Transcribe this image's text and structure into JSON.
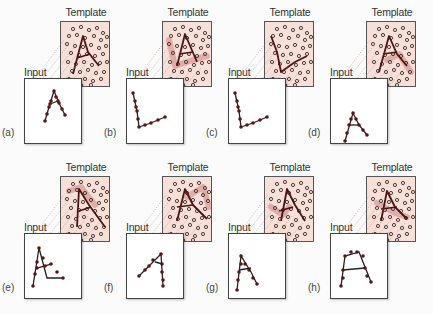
{
  "figure": {
    "template_label": "Template",
    "input_label": "Input",
    "colors": {
      "template_bg": "#f6e0d8",
      "stroke": "#4a1414",
      "highlight": "#c8706c",
      "dot_ring": "#3a2a2a",
      "link": "#c87878"
    },
    "template_dots": [
      [
        12,
        7
      ],
      [
        20,
        5
      ],
      [
        28,
        8
      ],
      [
        36,
        6
      ],
      [
        42,
        11
      ],
      [
        8,
        14
      ],
      [
        16,
        13
      ],
      [
        24,
        16
      ],
      [
        33,
        14
      ],
      [
        40,
        18
      ],
      [
        46,
        15
      ],
      [
        6,
        22
      ],
      [
        14,
        24
      ],
      [
        22,
        25
      ],
      [
        30,
        23
      ],
      [
        38,
        26
      ],
      [
        45,
        24
      ],
      [
        10,
        31
      ],
      [
        18,
        33
      ],
      [
        26,
        32
      ],
      [
        34,
        34
      ],
      [
        42,
        32
      ],
      [
        7,
        40
      ],
      [
        15,
        42
      ],
      [
        23,
        40
      ],
      [
        31,
        43
      ],
      [
        39,
        41
      ],
      [
        46,
        40
      ],
      [
        11,
        49
      ],
      [
        19,
        50
      ],
      [
        27,
        48
      ],
      [
        35,
        51
      ],
      [
        43,
        50
      ],
      [
        8,
        57
      ],
      [
        16,
        58
      ],
      [
        24,
        57
      ],
      [
        32,
        59
      ],
      [
        40,
        57
      ],
      [
        20,
        63
      ],
      [
        30,
        63
      ]
    ],
    "panels": [
      {
        "tag": "(a)",
        "left": 24,
        "top": 0,
        "template_stroke": [
          [
            12,
            52
          ],
          [
            22,
            14
          ],
          [
            27,
            30
          ],
          [
            38,
            44
          ]
        ],
        "template_bar": [
          [
            16,
            36
          ],
          [
            29,
            32
          ]
        ],
        "input_stroke": [
          [
            20,
            42
          ],
          [
            24,
            28
          ],
          [
            29,
            12
          ],
          [
            34,
            24
          ],
          [
            40,
            36
          ]
        ],
        "input_bar": [
          [
            25,
            25
          ],
          [
            33,
            22
          ]
        ],
        "input_dots": [
          [
            20,
            42
          ],
          [
            22,
            35
          ],
          [
            24,
            28
          ],
          [
            26,
            22
          ],
          [
            29,
            12
          ],
          [
            31,
            18
          ],
          [
            34,
            24
          ],
          [
            37,
            30
          ],
          [
            40,
            36
          ],
          [
            25,
            25
          ],
          [
            33,
            22
          ]
        ],
        "highlight": null
      },
      {
        "tag": "(b)",
        "left": 126,
        "top": 0,
        "template_stroke": [
          [
            14,
            44
          ],
          [
            22,
            12
          ],
          [
            34,
            40
          ]
        ],
        "template_bar": [
          [
            16,
            32
          ],
          [
            30,
            30
          ]
        ],
        "highlight_path": [
          [
            6,
            18
          ],
          [
            12,
            44
          ],
          [
            30,
            38
          ],
          [
            44,
            34
          ]
        ],
        "input_stroke": [
          [
            6,
            14
          ],
          [
            10,
            32
          ],
          [
            12,
            48
          ],
          [
            24,
            44
          ],
          [
            38,
            38
          ]
        ],
        "input_bar": null,
        "input_dots": [
          [
            6,
            14
          ],
          [
            8,
            22
          ],
          [
            9,
            28
          ],
          [
            10,
            32
          ],
          [
            11,
            40
          ],
          [
            12,
            48
          ],
          [
            18,
            46
          ],
          [
            24,
            44
          ],
          [
            31,
            41
          ],
          [
            38,
            38
          ]
        ]
      },
      {
        "tag": "(c)",
        "left": 228,
        "top": 0,
        "template_stroke": [
          [
            6,
            14
          ],
          [
            12,
            30
          ],
          [
            16,
            50
          ],
          [
            30,
            40
          ],
          [
            42,
            34
          ]
        ],
        "template_bar": null,
        "highlight_path": null,
        "input_stroke": [
          [
            6,
            14
          ],
          [
            10,
            32
          ],
          [
            12,
            48
          ],
          [
            24,
            44
          ],
          [
            38,
            38
          ]
        ],
        "input_bar": null,
        "input_dots": [
          [
            6,
            14
          ],
          [
            8,
            22
          ],
          [
            9,
            28
          ],
          [
            10,
            32
          ],
          [
            11,
            40
          ],
          [
            12,
            48
          ],
          [
            18,
            46
          ],
          [
            24,
            44
          ],
          [
            31,
            41
          ],
          [
            38,
            38
          ]
        ]
      },
      {
        "tag": "(d)",
        "left": 330,
        "top": 0,
        "template_stroke": [
          [
            12,
            50
          ],
          [
            22,
            14
          ],
          [
            30,
            32
          ],
          [
            40,
            44
          ]
        ],
        "template_bar": [
          [
            16,
            32
          ],
          [
            30,
            30
          ]
        ],
        "highlight_path": [
          [
            20,
            38
          ],
          [
            32,
            32
          ],
          [
            44,
            50
          ]
        ],
        "input_stroke": [
          [
            14,
            62
          ],
          [
            22,
            34
          ],
          [
            28,
            46
          ],
          [
            36,
            56
          ]
        ],
        "input_bar": [
          [
            18,
            46
          ],
          [
            28,
            46
          ]
        ],
        "input_dots": [
          [
            14,
            62
          ],
          [
            16,
            54
          ],
          [
            18,
            46
          ],
          [
            20,
            40
          ],
          [
            22,
            34
          ],
          [
            25,
            40
          ],
          [
            28,
            46
          ],
          [
            32,
            51
          ],
          [
            36,
            56
          ]
        ]
      },
      {
        "tag": "(e)",
        "left": 24,
        "top": 155,
        "template_stroke": [
          [
            16,
            50
          ],
          [
            18,
            12
          ],
          [
            28,
            28
          ],
          [
            44,
            50
          ]
        ],
        "template_bar": [
          [
            18,
            34
          ],
          [
            30,
            30
          ]
        ],
        "highlight_path": [
          [
            8,
            14
          ],
          [
            20,
            10
          ],
          [
            34,
            28
          ]
        ],
        "input_stroke": [
          [
            8,
            52
          ],
          [
            14,
            14
          ],
          [
            22,
            44
          ],
          [
            38,
            44
          ]
        ],
        "input_bar": [
          [
            12,
            34
          ],
          [
            26,
            30
          ]
        ],
        "input_dots": [
          [
            8,
            52
          ],
          [
            10,
            40
          ],
          [
            12,
            28
          ],
          [
            14,
            14
          ],
          [
            18,
            24
          ],
          [
            20,
            32
          ],
          [
            26,
            30
          ],
          [
            32,
            38
          ],
          [
            38,
            44
          ],
          [
            12,
            34
          ]
        ]
      },
      {
        "tag": "(f)",
        "left": 126,
        "top": 155,
        "template_stroke": [
          [
            14,
            44
          ],
          [
            22,
            12
          ],
          [
            30,
            28
          ],
          [
            44,
            42
          ]
        ],
        "template_bar": [
          [
            14,
            30
          ],
          [
            30,
            28
          ]
        ],
        "highlight_path": [
          [
            24,
            20
          ],
          [
            40,
            10
          ],
          [
            46,
            30
          ]
        ],
        "input_stroke": [
          [
            12,
            42
          ],
          [
            22,
            32
          ],
          [
            34,
            20
          ],
          [
            36,
            52
          ]
        ],
        "input_bar": [
          [
            28,
            28
          ],
          [
            36,
            30
          ]
        ],
        "input_dots": [
          [
            12,
            42
          ],
          [
            18,
            36
          ],
          [
            22,
            32
          ],
          [
            26,
            26
          ],
          [
            34,
            20
          ],
          [
            35,
            30
          ],
          [
            35,
            38
          ],
          [
            36,
            46
          ],
          [
            36,
            52
          ]
        ]
      },
      {
        "tag": "(g)",
        "left": 228,
        "top": 155,
        "template_stroke": [
          [
            16,
            44
          ],
          [
            22,
            12
          ],
          [
            30,
            28
          ],
          [
            40,
            44
          ]
        ],
        "template_bar": [
          [
            14,
            34
          ],
          [
            28,
            30
          ]
        ],
        "highlight_path": [
          [
            6,
            30
          ],
          [
            18,
            38
          ],
          [
            24,
            30
          ]
        ],
        "input_stroke": [
          [
            8,
            56
          ],
          [
            12,
            22
          ],
          [
            22,
            38
          ],
          [
            28,
            50
          ]
        ],
        "input_bar": [
          [
            10,
            36
          ],
          [
            22,
            34
          ]
        ],
        "input_dots": [
          [
            8,
            56
          ],
          [
            9,
            46
          ],
          [
            10,
            38
          ],
          [
            12,
            30
          ],
          [
            12,
            22
          ],
          [
            16,
            30
          ],
          [
            20,
            36
          ],
          [
            24,
            44
          ],
          [
            28,
            50
          ]
        ]
      },
      {
        "tag": "(h)",
        "left": 330,
        "top": 155,
        "template_stroke": [
          [
            14,
            44
          ],
          [
            20,
            14
          ],
          [
            28,
            30
          ],
          [
            40,
            42
          ]
        ],
        "template_bar": [
          [
            14,
            32
          ],
          [
            30,
            30
          ]
        ],
        "highlight_path": [
          [
            10,
            26
          ],
          [
            28,
            36
          ],
          [
            40,
            40
          ]
        ],
        "input_stroke": [
          [
            10,
            52
          ],
          [
            14,
            22
          ],
          [
            28,
            18
          ],
          [
            40,
            48
          ]
        ],
        "input_bar": [
          [
            12,
            36
          ],
          [
            34,
            34
          ]
        ],
        "input_dots": [
          [
            10,
            52
          ],
          [
            12,
            44
          ],
          [
            12,
            36
          ],
          [
            14,
            22
          ],
          [
            20,
            18
          ],
          [
            26,
            18
          ],
          [
            32,
            22
          ],
          [
            34,
            34
          ],
          [
            36,
            42
          ],
          [
            40,
            48
          ]
        ]
      }
    ]
  }
}
